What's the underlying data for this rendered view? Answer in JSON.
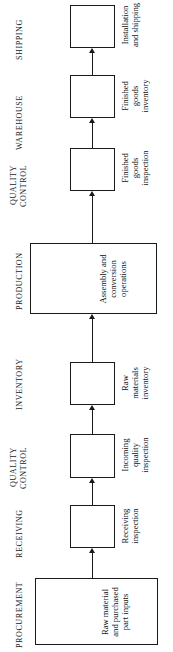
{
  "diagram": {
    "orientation": "rotated-90-ccw",
    "ink_color": "#1a1a1a",
    "background_color": "#ffffff",
    "stages": [
      {
        "id": "shipping",
        "label": "SHIPPING"
      },
      {
        "id": "warehouse",
        "label": "WAREHOUSE"
      },
      {
        "id": "quality-control-2",
        "label_line1": "QUALITY",
        "label_line2": "CONTROL"
      },
      {
        "id": "production",
        "label": "PRODUCTION"
      },
      {
        "id": "inventory",
        "label": "INVENTORY"
      },
      {
        "id": "quality-control-1",
        "label_line1": "QUALITY",
        "label_line2": "CONTROL"
      },
      {
        "id": "receiving",
        "label": "RECEIVING"
      },
      {
        "id": "procurement",
        "label": "PROCUREMENT"
      }
    ],
    "nodes": [
      {
        "id": "installation-and-shipping",
        "stage": "shipping",
        "caption_lines": [
          "Installation",
          "and shipping"
        ]
      },
      {
        "id": "finished-goods-inventory",
        "stage": "warehouse",
        "caption_lines": [
          "Finished",
          "goods",
          "inventory"
        ]
      },
      {
        "id": "finished-goods-inspection",
        "stage": "quality-control-2",
        "caption_lines": [
          "Finished",
          "goods",
          "inspection"
        ]
      },
      {
        "id": "assembly-and-conversion-operations",
        "stage": "production",
        "caption_lines": [
          "Assembly and",
          "conversion",
          "operations"
        ]
      },
      {
        "id": "raw-materials-inventory",
        "stage": "inventory",
        "caption_lines": [
          "Raw",
          "materials",
          "inventory"
        ]
      },
      {
        "id": "incoming-quality-inspection",
        "stage": "quality-control-1",
        "caption_lines": [
          "Incoming",
          "quality",
          "inspection"
        ]
      },
      {
        "id": "receiving-inspection",
        "stage": "receiving",
        "caption_lines": [
          "Receiving",
          "inspection"
        ]
      },
      {
        "id": "raw-material-and-purchased-part-inputs",
        "stage": "procurement",
        "caption_lines": [
          "Raw material",
          "and purchased",
          "part inputs"
        ]
      }
    ],
    "flow_order": [
      "raw-material-and-purchased-part-inputs",
      "receiving-inspection",
      "incoming-quality-inspection",
      "raw-materials-inventory",
      "assembly-and-conversion-operations",
      "finished-goods-inspection",
      "finished-goods-inventory",
      "installation-and-shipping"
    ]
  }
}
